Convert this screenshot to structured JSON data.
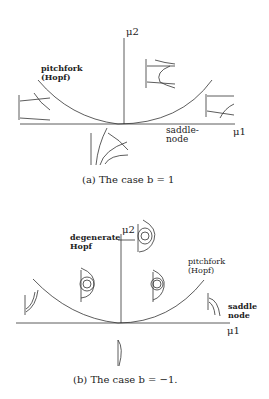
{
  "panel_a": {
    "axis_y_label": "μ2",
    "axis_x_label": "μ1",
    "curve_label_left": "pitchfork\n(Hopf)",
    "curve_label_right": "saddle-\nnode",
    "caption": "(a) The case b = 1"
  },
  "panel_b": {
    "axis_y_label": "μ2",
    "axis_x_label": "μ1",
    "label_degenerate": "degenerate\nHopf",
    "curve_label_right": "pitchfork\n(Hopf)",
    "curve_label_saddle": "saddle\nnode",
    "caption": "(b) The case b = −1."
  }
}
